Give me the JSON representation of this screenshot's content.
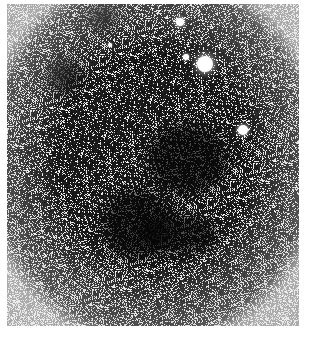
{
  "image": {
    "subject": "star field with dark nebula",
    "colors": {
      "background": "#1a1a1a",
      "stars": "#ffffff",
      "page": "#ffffff"
    },
    "bright_stars": [
      {
        "x": 205,
        "y": 64,
        "r": 8
      },
      {
        "x": 243,
        "y": 130,
        "r": 5
      },
      {
        "x": 186,
        "y": 57,
        "r": 3
      },
      {
        "x": 110,
        "y": 45,
        "r": 2
      },
      {
        "x": 180,
        "y": 22,
        "r": 4
      }
    ],
    "dark_regions": [
      {
        "x": 40,
        "y": 55,
        "w": 35,
        "h": 35
      },
      {
        "x": 140,
        "y": 120,
        "w": 80,
        "h": 70
      },
      {
        "x": 95,
        "y": 185,
        "w": 70,
        "h": 70
      },
      {
        "x": 130,
        "y": 210,
        "w": 80,
        "h": 40
      },
      {
        "x": 80,
        "y": 0,
        "w": 30,
        "h": 25
      }
    ]
  }
}
